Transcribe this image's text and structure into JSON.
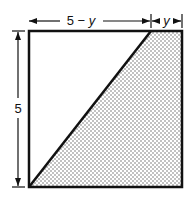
{
  "diagram": {
    "type": "geometry-square-with-diagonal",
    "top_labels": {
      "left_segment": {
        "prefix": "5 − ",
        "variable": "y"
      },
      "right_segment": {
        "variable": "y"
      }
    },
    "side_label": "5",
    "shaded_region": "triangle-right-side",
    "colors": {
      "stroke": "#111111",
      "shade_dot": "#555555",
      "background": "#ffffff"
    }
  }
}
